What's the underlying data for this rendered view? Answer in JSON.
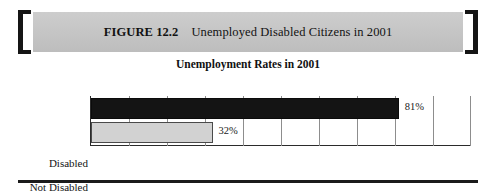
{
  "figure": {
    "number_label": "FIGURE 12.2",
    "caption": "Unemployed Disabled Citizens in 2001"
  },
  "chart_data": {
    "type": "bar",
    "orientation": "horizontal",
    "title": "Unemployment Rates in 2001",
    "categories": [
      "Disabled",
      "Not Disabled"
    ],
    "values": [
      81,
      32
    ],
    "value_labels": [
      "81%",
      "32%"
    ],
    "xlabel": "",
    "ylabel": "",
    "xlim": [
      0,
      100
    ],
    "tick_labels": [
      "0%",
      "10%",
      "20%",
      "30%",
      "40%",
      "50%",
      "60%",
      "70%",
      "80%",
      "90%",
      "100%"
    ],
    "tick_values": [
      0,
      10,
      20,
      30,
      40,
      50,
      60,
      70,
      80,
      90,
      100
    ],
    "grid": true,
    "legend": "none",
    "series_colors": [
      "#141414",
      "#d2d2d2"
    ]
  },
  "style": {
    "banner_color": "#c6c6c6",
    "bracket_color": "#151515",
    "rule_color": "#1b1b1b"
  }
}
